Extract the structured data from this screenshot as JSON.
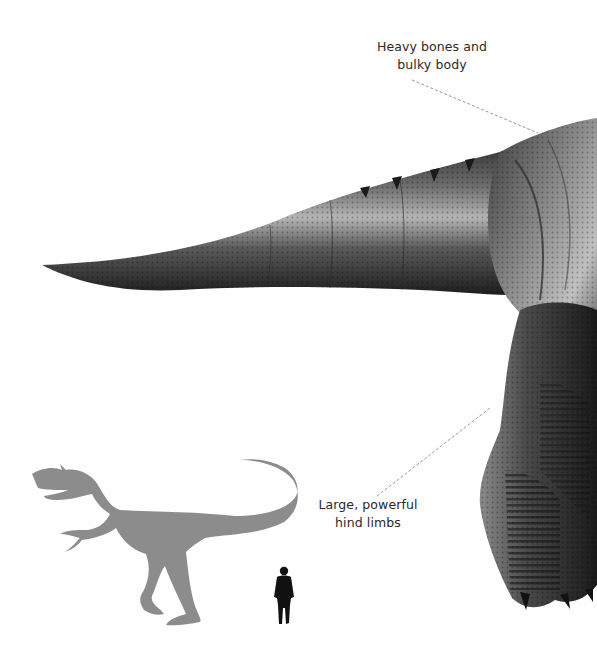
{
  "annotations": [
    {
      "id": "bones",
      "lines": [
        "Heavy bones and",
        "bulky body"
      ],
      "pointer": {
        "from": [
          412,
          80
        ],
        "to": [
          538,
          133
        ]
      }
    },
    {
      "id": "limbs",
      "lines": [
        "Large, powerful",
        "hind limbs"
      ],
      "pointer": {
        "from": [
          377,
          496
        ],
        "to": [
          490,
          408
        ]
      }
    }
  ],
  "figures": {
    "trex": {
      "name": "T. rex body (tail, hip, hind leg)",
      "color": "#4a4a4a"
    },
    "silhouette_dino": {
      "name": "Theropod size-comparison silhouette",
      "color": "#8c8c8c"
    },
    "silhouette_human": {
      "name": "Human size-comparison silhouette",
      "color": "#111111"
    }
  },
  "colors": {
    "background": "#ffffff",
    "label_text": "#2a2a2a",
    "pointer_line": "#9a9a9a"
  }
}
